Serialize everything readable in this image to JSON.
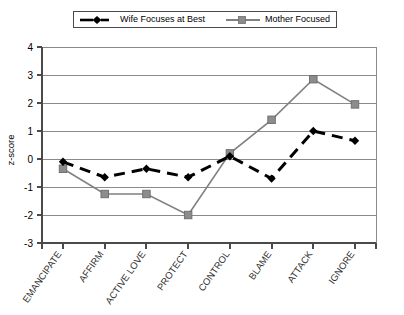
{
  "legend": {
    "position": "top-center",
    "entries": [
      {
        "label": "Wife Focuses at Best",
        "marker": "diamond-marker-icon",
        "style": "dashed",
        "color": "#000000"
      },
      {
        "label": "Mother Focused",
        "marker": "square-marker-icon",
        "style": "solid",
        "color": "#808080"
      }
    ]
  },
  "axes": {
    "ylabel": "z-score",
    "xlabel": "",
    "yticks": [
      "4",
      "3",
      "2",
      "1",
      "0",
      "-1",
      "-2",
      "-3"
    ]
  },
  "chart_data": {
    "type": "line",
    "title": "",
    "xlabel": "",
    "ylabel": "z-score",
    "ylim": [
      -3,
      4
    ],
    "ytick_values": [
      4,
      3,
      2,
      1,
      0,
      -1,
      -2,
      -3
    ],
    "grid": true,
    "legend_position": "top-center",
    "categories": [
      "EMANCIPATE",
      "AFFIRM",
      "ACTIVE LOVE",
      "PROTECT",
      "CONTROL",
      "BLAME",
      "ATTACK",
      "IGNORE"
    ],
    "series": [
      {
        "name": "Wife Focuses at Best",
        "color": "#000000",
        "linestyle": "dashed",
        "marker": "diamond",
        "values": [
          -0.1,
          -0.65,
          -0.35,
          -0.65,
          0.1,
          -0.7,
          1.0,
          0.65
        ]
      },
      {
        "name": "Mother Focused",
        "color": "#808080",
        "linestyle": "solid",
        "marker": "square",
        "values": [
          -0.35,
          -1.25,
          -1.25,
          -2.0,
          0.2,
          1.4,
          2.85,
          1.95
        ]
      }
    ]
  },
  "colors": {
    "wife_series": "#000000",
    "mother_series": "#808080",
    "gridline": "#808080",
    "axis": "#4a4a4a",
    "background": "#ffffff"
  }
}
